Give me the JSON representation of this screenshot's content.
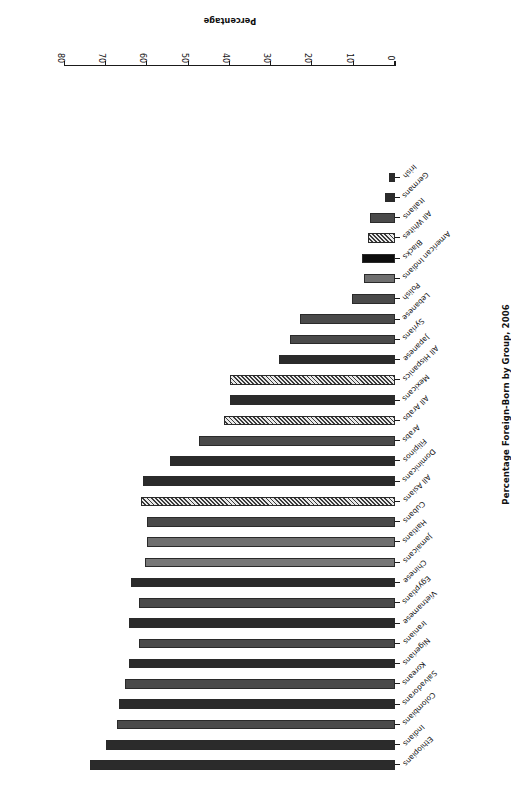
{
  "chart_data": {
    "type": "bar",
    "orientation": "horizontal",
    "title": "Percentage Foreign-Born by Group, 2006",
    "xlabel": "Percentage",
    "ylabel": "",
    "xlim": [
      0,
      80
    ],
    "xticks": [
      0,
      10,
      20,
      30,
      40,
      50,
      60,
      70,
      80
    ],
    "grid": false,
    "legend": "none",
    "rotated_180": true,
    "categories": [
      "Ethiopians",
      "Indians",
      "Colombians",
      "Salvadorans",
      "Koreans",
      "Nigerians",
      "Iranians",
      "Vietnamese",
      "Egyptians",
      "Chinese",
      "Jamaicans",
      "Haitians",
      "Cubans",
      "All Asians",
      "Dominicans",
      "Filipinos",
      "Arabs",
      "All Arabs",
      "Mexicans",
      "All Hispanics",
      "Japanese",
      "Syrians",
      "Lebanese",
      "Polish",
      "American Indians",
      "Blacks",
      "All Whites",
      "Italians",
      "Germans",
      "Irish"
    ],
    "values": [
      74.0,
      70.0,
      67.5,
      67.0,
      65.5,
      64.5,
      62.0,
      64.5,
      62.0,
      64.0,
      60.5,
      60.0,
      60.0,
      61.5,
      61.0,
      54.5,
      47.5,
      41.5,
      40.0,
      40.0,
      28.0,
      25.5,
      23.0,
      10.5,
      7.5,
      8.0,
      6.5,
      6.0,
      2.5,
      1.5
    ],
    "fills": [
      "dark",
      "dark",
      "mid",
      "dark",
      "mid",
      "dark",
      "mid",
      "dark",
      "mid",
      "dark",
      "light2",
      "light",
      "mid",
      "hatch",
      "dark",
      "dark",
      "mid",
      "hatch",
      "dark",
      "hatch",
      "dark",
      "mid",
      "mid",
      "mid",
      "light",
      "black",
      "hatch",
      "mid",
      "dark",
      "dark"
    ],
    "colors": {
      "dark": "#2b2b2b",
      "black": "#0d0d0d",
      "mid": "#4a4a4a",
      "mid2": "#555555",
      "light": "#6f6f6f",
      "light2": "#777777",
      "hatch": "#3a3a3a"
    }
  }
}
